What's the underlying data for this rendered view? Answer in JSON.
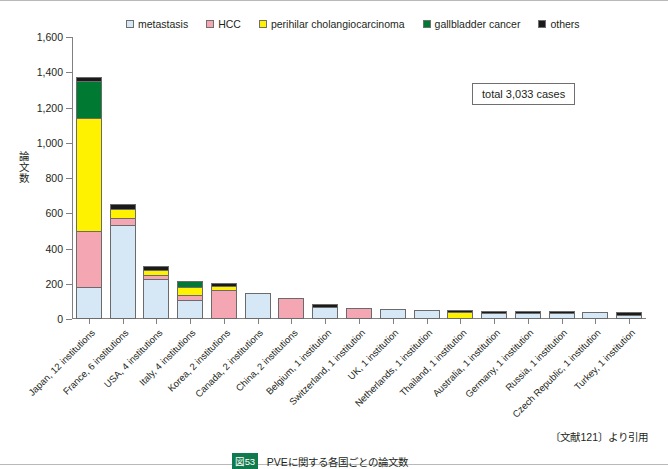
{
  "chart_data": {
    "type": "bar",
    "subtype": "stacked-vertical",
    "title": "",
    "xlabel": "",
    "ylabel": "論文数",
    "ylim": [
      0,
      1600
    ],
    "ytick_values": [
      0,
      200,
      400,
      600,
      800,
      1000,
      1200,
      1400,
      1600
    ],
    "ytick_labels": [
      "0",
      "200",
      "400",
      "600",
      "800",
      "1,000",
      "1,200",
      "1,400",
      "1,600"
    ],
    "grid": false,
    "legend_position": "top",
    "annotation": "total 3,033 cases",
    "categories": [
      "Japan, 12 institutions",
      "France, 6 institutions",
      "USA, 4 institutions",
      "Italy, 4 institutions",
      "Korea, 2 institutions",
      "Canada, 2 institutions",
      "China, 2 institutions",
      "Belgium, 1 institution",
      "Switzerland, 1 institution",
      "UK, 1 institution",
      "Netherlands, 1 institution",
      "Thailand, 1 institution",
      "Australia, 1 institution",
      "Germany, 1 institution",
      "Russia, 1 institution",
      "Czech Republic, 1 institution",
      "Turkey, 1 institution"
    ],
    "series": [
      {
        "name": "metastasis",
        "color": "#d6e8f5",
        "values": [
          170,
          520,
          213,
          95,
          0,
          138,
          0,
          55,
          0,
          45,
          38,
          0,
          22,
          20,
          20,
          28,
          14
        ]
      },
      {
        "name": "HCC",
        "color": "#f4a7b3",
        "values": [
          310,
          38,
          22,
          22,
          152,
          0,
          110,
          0,
          50,
          0,
          0,
          0,
          0,
          0,
          0,
          0,
          0
        ]
      },
      {
        "name": "perihilar cholangiocarcinoma",
        "color": "#fff200",
        "values": [
          640,
          43,
          20,
          40,
          16,
          0,
          0,
          0,
          0,
          0,
          0,
          30,
          0,
          0,
          0,
          0,
          0
        ]
      },
      {
        "name": "gallbladder cancer",
        "color": "#007a33",
        "values": [
          200,
          0,
          0,
          28,
          0,
          0,
          0,
          0,
          0,
          0,
          0,
          0,
          0,
          0,
          0,
          0,
          0
        ]
      },
      {
        "name": "others",
        "color": "#1a1a1a",
        "values": [
          22,
          24,
          15,
          0,
          12,
          0,
          0,
          15,
          0,
          0,
          0,
          5,
          8,
          10,
          8,
          0,
          11
        ]
      }
    ],
    "totals": [
      1342,
      625,
      270,
      185,
      180,
      138,
      110,
      70,
      50,
      45,
      38,
      35,
      30,
      30,
      28,
      28,
      25
    ]
  },
  "legend": {
    "items": [
      {
        "label": "metastasis",
        "color": "#d6e8f5"
      },
      {
        "label": "HCC",
        "color": "#f4a7b3"
      },
      {
        "label": "perihilar cholangiocarcinoma",
        "color": "#fff200"
      },
      {
        "label": "gallbladder cancer",
        "color": "#007a33"
      },
      {
        "label": "others",
        "color": "#1a1a1a"
      }
    ]
  },
  "footer": {
    "citation": "〔文献121〕より引用",
    "figure_tag": "図53",
    "caption": "PVEに関する各国ごとの論文数"
  }
}
